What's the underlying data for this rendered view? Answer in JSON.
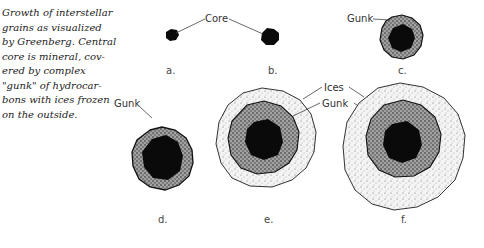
{
  "caption": {
    "lines": [
      "Growth of interstellar",
      "grains as visualized",
      "by Greenberg. Central",
      "core is mineral, cov-",
      "ered by complex",
      "\"gunk\" of hydrocar-",
      "bons with ices frozen",
      "on the outside."
    ]
  },
  "diagram": {
    "colors": {
      "core": "#0a0a0a",
      "gunk": "#8a8a8a",
      "ices": "#ececec",
      "outline": "#222222"
    },
    "labels": {
      "core": "Core",
      "gunk_c": "Gunk",
      "gunk_d": "Gunk",
      "ices_e": "Ices",
      "gunk_e": "Gunk"
    },
    "stages": [
      {
        "id": "a",
        "label": "a.",
        "layers": [
          "core"
        ]
      },
      {
        "id": "b",
        "label": "b.",
        "layers": [
          "core"
        ]
      },
      {
        "id": "c",
        "label": "c.",
        "layers": [
          "core",
          "gunk"
        ]
      },
      {
        "id": "d",
        "label": "d.",
        "layers": [
          "core",
          "gunk"
        ]
      },
      {
        "id": "e",
        "label": "e.",
        "layers": [
          "core",
          "gunk",
          "ices"
        ]
      },
      {
        "id": "f",
        "label": "f.",
        "layers": [
          "core",
          "gunk",
          "ices"
        ]
      }
    ]
  }
}
